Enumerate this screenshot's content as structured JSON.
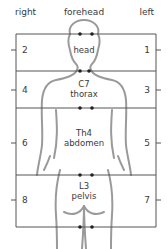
{
  "header": {
    "right_label": "right",
    "center_label": "forehead",
    "left_label": "left"
  },
  "regions": [
    {
      "lines": [
        "",
        "head"
      ],
      "right_number": "2",
      "left_number": "1"
    },
    {
      "lines": [
        "C7",
        "thorax"
      ],
      "right_number": "4",
      "left_number": "3"
    },
    {
      "lines": [
        "Th4",
        "abdomen"
      ],
      "right_number": "6",
      "left_number": "5"
    },
    {
      "lines": [
        "L3",
        "pelvis"
      ],
      "right_number": "8",
      "left_number": "7"
    }
  ],
  "colors": {
    "box_line": "#555555",
    "silhouette": "#9a9a9a",
    "dot": "#222222",
    "text": "#3a3a3a"
  }
}
